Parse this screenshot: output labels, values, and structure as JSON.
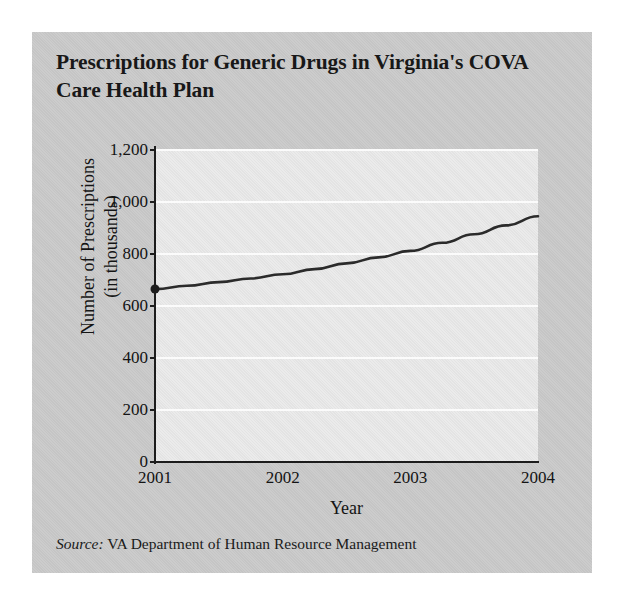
{
  "figure": {
    "title": "Prescriptions for Generic Drugs in Virginia's COVA Care Health Plan",
    "source_label": "Source:",
    "source_text": "VA Department of Human Resource Management",
    "background_color": "#c9c9c9",
    "plot_background_color": "#e6e6e6",
    "line_color": "#2b2b2b",
    "gridline_color": "#fbfbfb"
  },
  "chart_data": {
    "type": "line",
    "title": "Prescriptions for Generic Drugs in Virginia's COVA Care Health Plan",
    "xlabel": "Year",
    "ylabel": "Number of Prescriptions (in thousands)",
    "ylabel_line1": "Number of Prescriptions",
    "ylabel_line2": "(in thousands)",
    "x": [
      2001,
      2002,
      2003,
      2004
    ],
    "xtick_labels": [
      "2001",
      "2002",
      "2003",
      "2004"
    ],
    "ytick_labels": [
      "0",
      "200",
      "400",
      "600",
      "800",
      "1,000",
      "1,200"
    ],
    "ytick_values": [
      0,
      200,
      400,
      600,
      800,
      1000,
      1200
    ],
    "ylim": [
      0,
      1200
    ],
    "xlim": [
      2001,
      2004
    ],
    "grid": "horizontal",
    "legend": "none",
    "markers": [
      {
        "x": 2001,
        "y": 665
      }
    ],
    "series": [
      {
        "name": "Number of Prescriptions (in thousands)",
        "values": [
          665,
          720,
          810,
          945
        ],
        "curve_points": [
          {
            "x": 2001.0,
            "y": 665
          },
          {
            "x": 2001.25,
            "y": 678
          },
          {
            "x": 2001.5,
            "y": 692
          },
          {
            "x": 2001.75,
            "y": 706
          },
          {
            "x": 2002.0,
            "y": 722
          },
          {
            "x": 2002.25,
            "y": 742
          },
          {
            "x": 2002.5,
            "y": 764
          },
          {
            "x": 2002.75,
            "y": 787
          },
          {
            "x": 2003.0,
            "y": 812
          },
          {
            "x": 2003.25,
            "y": 843
          },
          {
            "x": 2003.5,
            "y": 876
          },
          {
            "x": 2003.75,
            "y": 910
          },
          {
            "x": 2004.0,
            "y": 945
          }
        ]
      }
    ]
  }
}
